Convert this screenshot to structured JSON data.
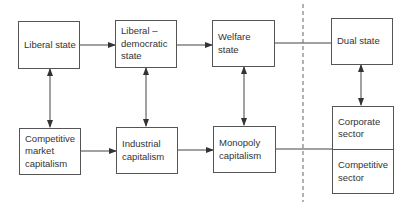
{
  "diagram": {
    "top_row": [
      {
        "id": "liberal-state",
        "label": "Liberal state"
      },
      {
        "id": "liberal-democratic-state",
        "label": "Liberal –\ndemocratic\nstate"
      },
      {
        "id": "welfare-state",
        "label": "Welfare\nstate"
      },
      {
        "id": "dual-state",
        "label": "Dual state"
      }
    ],
    "bottom_row": [
      {
        "id": "competitive-market-capitalism",
        "label": "Competitive\nmarket\ncapitalism"
      },
      {
        "id": "industrial-capitalism",
        "label": "Industrial\ncapitalism"
      },
      {
        "id": "monopoly-capitalism",
        "label": "Monopoly\ncapitalism"
      },
      {
        "id": "corporate-sector",
        "label": "Corporate\nsector"
      },
      {
        "id": "competitive-sector",
        "label": "Competitive\nsector"
      }
    ],
    "colors": {
      "line": "#444444",
      "text": "#333333",
      "background": "#ffffff"
    }
  }
}
